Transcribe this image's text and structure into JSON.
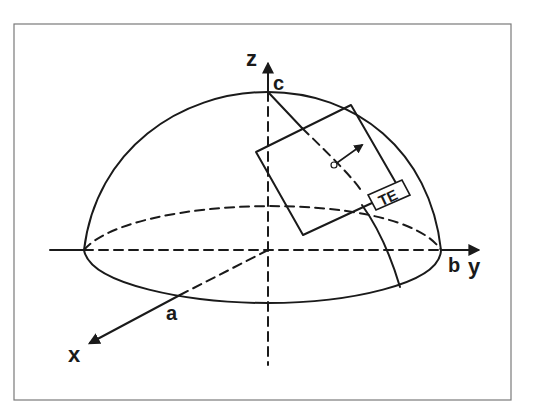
{
  "figure": {
    "axes": {
      "x": "x",
      "y": "y",
      "z": "z"
    },
    "points": {
      "a": "a",
      "b": "b",
      "c": "c"
    },
    "tangent_element_label": "TE",
    "colors": {
      "stroke": "#1a1a1a",
      "frame": "#7a7a7a",
      "background": "#ffffff"
    }
  }
}
